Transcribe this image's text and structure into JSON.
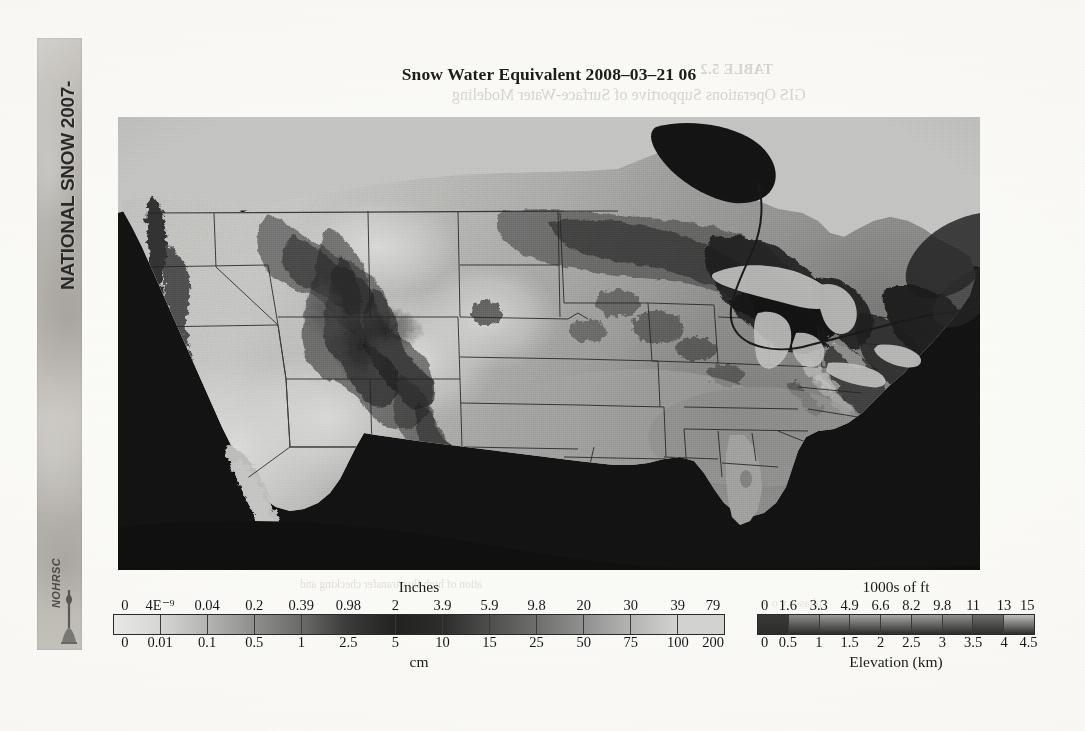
{
  "page": {
    "background_color": "#f8f7f3",
    "ghost_text": {
      "table_label": "TABLE 5.2",
      "table_caption": "GIS Operations Supportive of Surface-Water Modeling",
      "body_line_1": "ation of high flux/transfer checking and",
      "body_line_2": "phases   v   o   w"
    }
  },
  "spine": {
    "line_1": "NATIONAL SNOW",
    "line_2": "ANALYSIS",
    "years_top": "2007-",
    "years_bottom": "2008",
    "line_1_full": "NATIONAL SNOW 2007-",
    "line_2_full": "ANALYSIS 2008",
    "logo_text": "NOHRSC"
  },
  "title": "Snow Water Equivalent 2008–03–21 06",
  "chart_data": {
    "type": "heatmap",
    "variable": "Snow Water Equivalent",
    "valid_datetime": "2008-03-21 06",
    "grid": false,
    "legend_position": "bottom",
    "colormap": "grayscale",
    "legends": [
      {
        "name": "swe",
        "heading": "Inches",
        "footing": "cm",
        "units_top": "in",
        "units_bottom": "cm",
        "ticks_top": [
          "0",
          "4E⁻⁹",
          "0.04",
          "0.2",
          "0.39",
          "0.98",
          "2",
          "3.9",
          "5.9",
          "9.8",
          "20",
          "30",
          "39",
          "79"
        ],
        "ticks_bottom": [
          "0",
          "0.01",
          "0.1",
          "0.5",
          "1",
          "2.5",
          "5",
          "10",
          "15",
          "25",
          "50",
          "75",
          "100",
          "200"
        ],
        "segment_colors": [
          "#e8e8e6",
          "#d6d6d4",
          "#b4b4b2",
          "#8e8e8c",
          "#6a6a69",
          "#3a3a3a",
          "#222222",
          "#2c2c2c",
          "#4e4e4d",
          "#6e6e6d",
          "#909090",
          "#b4b4b3",
          "#d2d2d1"
        ]
      },
      {
        "name": "elevation",
        "heading": "1000s of ft",
        "footing": "Elevation (km)",
        "units_top": "1000s of ft",
        "units_bottom": "km",
        "ticks_top": [
          "0",
          "1.6",
          "3.3",
          "4.9",
          "6.6",
          "8.2",
          "9.8",
          "11",
          "13",
          "15"
        ],
        "ticks_bottom": [
          "0",
          "0.5",
          "1",
          "1.5",
          "2",
          "2.5",
          "3",
          "3.5",
          "4",
          "4.5"
        ],
        "segment_colors": [
          "#3a3a39",
          "#8c8c8a",
          "#9b9b99",
          "#a3a3a1",
          "#a9a9a7",
          "#9e9e9c",
          "#8f8f8d",
          "#6e6e6c",
          "#c0c0be"
        ]
      }
    ]
  }
}
